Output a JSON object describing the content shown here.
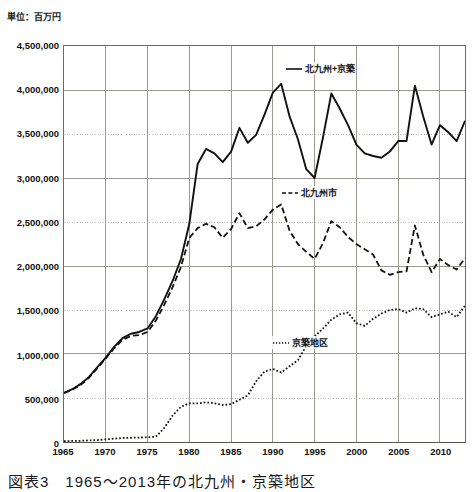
{
  "unit_label": "単位：百万円",
  "caption": "図表3　1965〜2013年の北九州・京築地区",
  "axes": {
    "y_ticks": [
      "4,500,000",
      "4,000,000",
      "3,500,000",
      "3,000,000",
      "2,500,000",
      "2,000,000",
      "1,500,000",
      "1,000,000",
      "500,000",
      "0"
    ],
    "x_ticks": [
      "1965",
      "1970",
      "1975",
      "1980",
      "1985",
      "1990",
      "1995",
      "2000",
      "2005",
      "2010"
    ]
  },
  "legend": {
    "total_label": "北九州+京築",
    "city_label": "北九州市",
    "keichiku_label": "京築地区"
  },
  "colors": {
    "line": "#111111",
    "frame": "#6b6b66",
    "grid_solid": "#9a9a93",
    "grid_dotted": "#b5b5ad",
    "background": "#ffffff"
  },
  "chart_data": {
    "type": "line",
    "title": "図表3　1965〜2013年の北九州・京築地区",
    "xlabel": "",
    "ylabel": "単位：百万円",
    "xlim": [
      1965,
      2013
    ],
    "ylim": [
      0,
      4500000
    ],
    "grid": true,
    "legend_position": "inside",
    "x": [
      1965,
      1966,
      1967,
      1968,
      1969,
      1970,
      1971,
      1972,
      1973,
      1974,
      1975,
      1976,
      1977,
      1978,
      1979,
      1980,
      1981,
      1982,
      1983,
      1984,
      1985,
      1986,
      1987,
      1988,
      1989,
      1990,
      1991,
      1992,
      1993,
      1994,
      1995,
      1996,
      1997,
      1998,
      1999,
      2000,
      2001,
      2002,
      2003,
      2004,
      2005,
      2006,
      2007,
      2008,
      2009,
      2010,
      2011,
      2012,
      2013
    ],
    "series": [
      {
        "name": "北九州+京築",
        "style": "solid",
        "values": [
          560000,
          600000,
          660000,
          740000,
          850000,
          960000,
          1080000,
          1180000,
          1230000,
          1250000,
          1290000,
          1430000,
          1620000,
          1830000,
          2080000,
          2480000,
          3160000,
          3330000,
          3280000,
          3180000,
          3300000,
          3570000,
          3400000,
          3490000,
          3720000,
          3970000,
          4070000,
          3700000,
          3440000,
          3100000,
          3000000,
          3460000,
          3960000,
          3790000,
          3600000,
          3380000,
          3280000,
          3250000,
          3230000,
          3300000,
          3420000,
          3420000,
          4050000,
          3700000,
          3380000,
          3600000,
          3520000,
          3420000,
          3650000
        ]
      },
      {
        "name": "北九州市",
        "style": "dashed",
        "values": [
          555000,
          595000,
          650000,
          730000,
          840000,
          950000,
          1065000,
          1160000,
          1205000,
          1215000,
          1250000,
          1380000,
          1560000,
          1760000,
          1990000,
          2320000,
          2430000,
          2480000,
          2440000,
          2320000,
          2420000,
          2600000,
          2430000,
          2450000,
          2530000,
          2640000,
          2700000,
          2400000,
          2250000,
          2160000,
          2080000,
          2260000,
          2510000,
          2440000,
          2330000,
          2250000,
          2190000,
          2130000,
          1950000,
          1900000,
          1930000,
          1940000,
          2460000,
          2130000,
          1930000,
          2080000,
          2010000,
          1960000,
          2090000
        ]
      },
      {
        "name": "京築地区",
        "style": "dotted",
        "values": [
          10000,
          12000,
          14000,
          18000,
          22000,
          30000,
          38000,
          45000,
          48000,
          50000,
          55000,
          60000,
          160000,
          300000,
          400000,
          440000,
          440000,
          450000,
          440000,
          420000,
          430000,
          480000,
          530000,
          690000,
          800000,
          830000,
          790000,
          860000,
          930000,
          1090000,
          1200000,
          1290000,
          1390000,
          1450000,
          1470000,
          1350000,
          1320000,
          1400000,
          1460000,
          1500000,
          1510000,
          1470000,
          1520000,
          1510000,
          1420000,
          1450000,
          1480000,
          1420000,
          1550000
        ]
      }
    ]
  }
}
